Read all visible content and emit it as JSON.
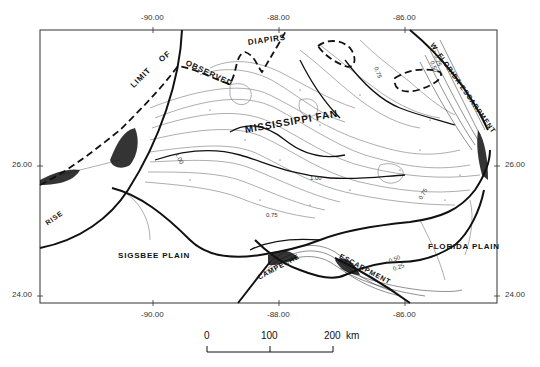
{
  "map": {
    "longitude_ticks_top": [
      {
        "label": "-90.00",
        "x": 153
      },
      {
        "label": "-88.00",
        "x": 279
      },
      {
        "label": "-86.00",
        "x": 405
      }
    ],
    "longitude_ticks_bottom": [
      {
        "label": "-90.00",
        "x": 153
      },
      {
        "label": "-88.00",
        "x": 279
      },
      {
        "label": "-86.00",
        "x": 405
      }
    ],
    "latitude_ticks_left": [
      {
        "label": "26.00",
        "y": 166
      },
      {
        "label": "24.00",
        "y": 296
      }
    ],
    "latitude_ticks_right": [
      {
        "label": "26.00",
        "y": 166
      },
      {
        "label": "24.00",
        "y": 296
      }
    ],
    "feature_labels": {
      "limit": "LIMIT",
      "of": "OF",
      "observed": "OBSERVED",
      "diapirs": "DIAPIRS",
      "mississippi_fan": "MISSISSIPPI FAN",
      "w_florida_escarpment": "W. FLORIDA ESCARPMENT",
      "rise": "RISE",
      "sigsbee_plain": "SIGSBEE PLAIN",
      "campeche": "CAMPECHE",
      "escarpment": "ESCARPMENT",
      "florida_plain": "FLORIDA PLAIN"
    },
    "contour_labels": {
      "c_100_west": "1.00",
      "c_100_center": "1.00",
      "c_075_ne": "0.75",
      "c_075_east": "0.75",
      "c_075_south": "0.75",
      "c_025_ne": "0.25",
      "c_050_ne": "0.50",
      "c_050_se": "0.50",
      "c_025_se": "0.25"
    },
    "scale_bar": {
      "labels": [
        "0",
        "100",
        "200"
      ],
      "unit": "km"
    },
    "colors": {
      "ink": "#111111",
      "contour": "#555555",
      "contour_light": "#888888",
      "frame": "#333333",
      "background": "#ffffff"
    }
  }
}
